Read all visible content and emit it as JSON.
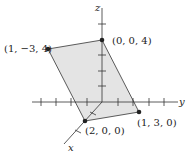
{
  "diagram": {
    "type": "3d-coordinate-parallelogram",
    "axes": {
      "x": "x",
      "y": "y",
      "z": "z"
    },
    "vertices": [
      {
        "label": "(0, 0, 4)"
      },
      {
        "label": "(1, −3, 4)"
      },
      {
        "label": "(2, 0, 0)"
      },
      {
        "label": "(1, 3, 0)"
      }
    ],
    "fill_color": "#e6e6e6",
    "line_color": "#333333"
  }
}
